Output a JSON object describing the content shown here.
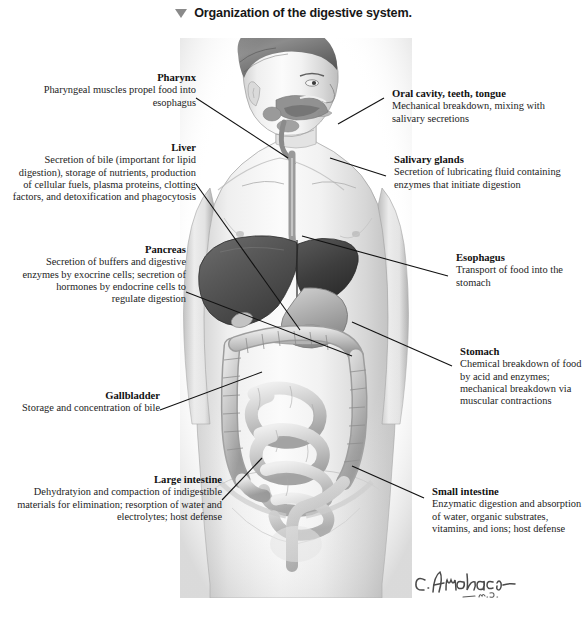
{
  "figure": {
    "marker_icon": "down-triangle-icon",
    "title": "Organization of the digestive system.",
    "signature": "C.Machado",
    "signature_suffix": "M.D.",
    "background_color": "#ffffff",
    "leader_line_color": "#111111",
    "marker_color": "#8a8a8a"
  },
  "labels_left": [
    {
      "id": "pharynx",
      "heading": "Pharynx",
      "body": "Pharyngeal muscles propel food into esophagus"
    },
    {
      "id": "liver",
      "heading": "Liver",
      "body": "Secretion of bile (important for lipid digestion), storage of nutrients, production of cellular fuels, plasma proteins, clotting factors, and detoxification and phagocytosis"
    },
    {
      "id": "pancreas",
      "heading": "Pancreas",
      "body": "Secretion of buffers and digestive enzymes by exocrine cells; secretion of hormones by endocrine cells to regulate digestion"
    },
    {
      "id": "gallbladder",
      "heading": "Gallbladder",
      "body": "Storage and concentration of bile"
    },
    {
      "id": "large-intestine",
      "heading": "Large intestine",
      "body": "Dehydratyion and compaction of indigestible materials for elimination;  resorption of water and electrolytes; host defense"
    }
  ],
  "labels_right": [
    {
      "id": "oral-cavity",
      "heading": "Oral cavity, teeth, tongue",
      "body": "Mechanical breakdown, mixing with salivary secretions"
    },
    {
      "id": "salivary-glands",
      "heading": "Salivary glands",
      "body": "Secretion of lubricating fluid containing enzymes that initiate digestion"
    },
    {
      "id": "esophagus",
      "heading": "Esophagus",
      "body": "Transport of food into the stomach"
    },
    {
      "id": "stomach",
      "heading": "Stomach",
      "body": "Chemical breakdown of food by acid and enzymes; mechanical breakdown via muscular contractions"
    },
    {
      "id": "small-intestine",
      "heading": "Small intestine",
      "body": "Enzymatic digestion and absorption of water, organic substrates, vitamins, and ions; host defense"
    }
  ],
  "illustration": {
    "name": "human-digestive-system-anatomical-drawing",
    "style": "grayscale pencil rendering, anterior view of male torso with head turned",
    "organs": [
      "oral cavity",
      "tongue",
      "salivary glands",
      "pharynx",
      "esophagus",
      "liver",
      "gallbladder",
      "stomach",
      "pancreas",
      "large intestine",
      "small intestine",
      "rectum"
    ]
  }
}
